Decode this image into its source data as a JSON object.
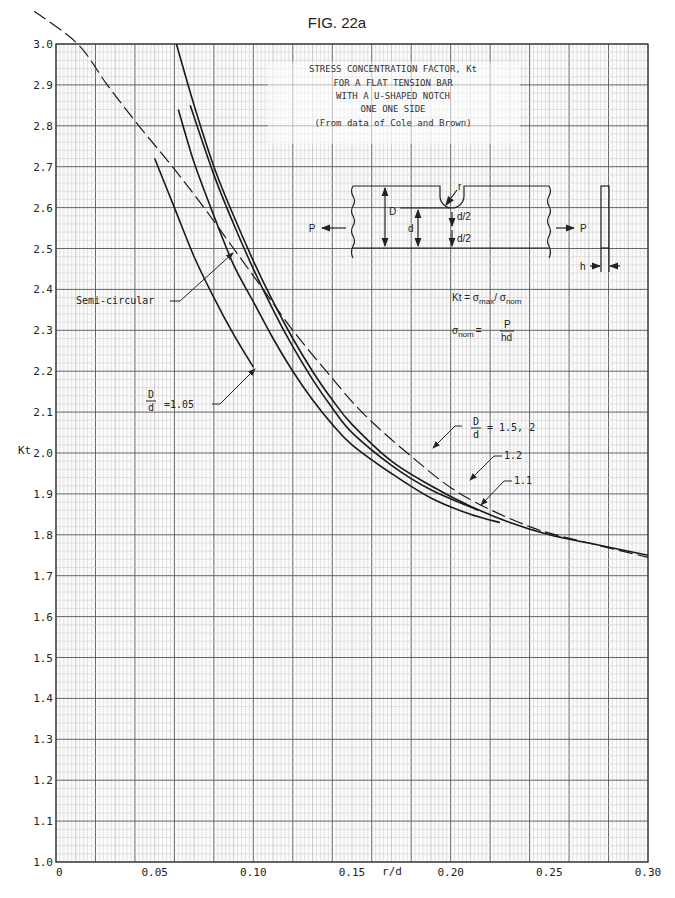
{
  "chart_data": {
    "type": "line",
    "figure_label": "FIG. 22a",
    "title_lines": [
      "STRESS CONCENTRATION FACTOR, Kt",
      "FOR A FLAT TENSION BAR",
      "WITH A U-SHAPED NOTCH",
      "ONE ONE SIDE",
      "(From data of Cole and Brown)"
    ],
    "xlabel": "r/d",
    "ylabel": "Kt",
    "xlim": [
      0,
      0.3
    ],
    "ylim": [
      1.0,
      3.0
    ],
    "grid": true,
    "x_ticks": [
      0,
      0.05,
      0.1,
      0.15,
      0.2,
      0.25,
      0.3
    ],
    "x_tick_labels": [
      "0",
      "0.05",
      "0.10",
      "0.15",
      "0.20",
      "0.25",
      "0.30"
    ],
    "y_ticks": [
      1.0,
      1.1,
      1.2,
      1.3,
      1.4,
      1.5,
      1.6,
      1.7,
      1.8,
      1.9,
      2.0,
      2.1,
      2.2,
      2.3,
      2.4,
      2.5,
      2.6,
      2.7,
      2.8,
      2.9,
      3.0
    ],
    "y_tick_labels": [
      "1.0",
      "1.1",
      "1.2",
      "1.3",
      "1.4",
      "1.5",
      "1.6",
      "1.7",
      "1.8",
      "1.9",
      "2.0",
      "2.1",
      "2.2",
      "2.3",
      "2.4",
      "2.5",
      "2.6",
      "2.7",
      "2.8",
      "2.9",
      "3.0"
    ],
    "series": [
      {
        "name": "Semi-circular",
        "style": "dashed",
        "x": [
          -0.011,
          0.011,
          0.026,
          0.042,
          0.059,
          0.075,
          0.09,
          0.105,
          0.12,
          0.137,
          0.155,
          0.178,
          0.205,
          0.24,
          0.27,
          0.3
        ],
        "y": [
          3.08,
          3.0,
          2.9,
          2.8,
          2.7,
          2.6,
          2.5,
          2.4,
          2.3,
          2.2,
          2.1,
          2.0,
          1.9,
          1.82,
          1.78,
          1.745
        ]
      },
      {
        "name": "D/d = 1.5, 2",
        "style": "solid",
        "x": [
          0.061,
          0.07,
          0.08,
          0.09,
          0.1,
          0.11,
          0.12,
          0.13,
          0.14,
          0.15,
          0.17,
          0.19,
          0.21,
          0.23,
          0.25,
          0.27,
          0.3
        ],
        "y": [
          3.0,
          2.85,
          2.7,
          2.58,
          2.47,
          2.37,
          2.28,
          2.2,
          2.13,
          2.07,
          1.98,
          1.92,
          1.87,
          1.83,
          1.8,
          1.78,
          1.75
        ]
      },
      {
        "name": "D/d = 1.2",
        "style": "solid",
        "x": [
          0.068,
          0.08,
          0.09,
          0.1,
          0.11,
          0.12,
          0.13,
          0.14,
          0.15,
          0.17,
          0.19,
          0.214
        ],
        "y": [
          2.85,
          2.68,
          2.56,
          2.45,
          2.35,
          2.26,
          2.18,
          2.11,
          2.05,
          1.97,
          1.91,
          1.86
        ]
      },
      {
        "name": "D/d = 1.1",
        "style": "solid",
        "x": [
          0.062,
          0.07,
          0.08,
          0.09,
          0.1,
          0.11,
          0.12,
          0.13,
          0.14,
          0.15,
          0.17,
          0.19,
          0.21,
          0.225
        ],
        "y": [
          2.84,
          2.71,
          2.58,
          2.46,
          2.37,
          2.28,
          2.2,
          2.13,
          2.07,
          2.02,
          1.95,
          1.89,
          1.85,
          1.83
        ]
      },
      {
        "name": "D/d = 1.05",
        "style": "solid",
        "x": [
          0.05,
          0.06,
          0.07,
          0.08,
          0.09,
          0.1
        ],
        "y": [
          2.72,
          2.6,
          2.48,
          2.38,
          2.29,
          2.21
        ]
      }
    ],
    "annotations": {
      "semi_circular": "Semi-circular",
      "d105_value": "=1.05",
      "d15_value": "= 1.5,  2",
      "d12": "1.2",
      "d11": "1.1",
      "frac_num": "D",
      "frac_den": "d"
    },
    "diagram": {
      "load": "P",
      "big_d": "D",
      "small_d": "d",
      "half_d_top": "d/2",
      "half_d_bottom": "d/2",
      "notch_radius": "r",
      "thickness": "h",
      "formula_kt_lhs": "Kt = σ",
      "formula_kt_max": "max",
      "formula_kt_slash": "/ σ",
      "formula_kt_nom": "nom",
      "formula_nom_lhs": "σ",
      "formula_nom_sub": "nom",
      "formula_nom_eq": "=",
      "formula_nom_num": "P",
      "formula_nom_den": "hd"
    }
  }
}
